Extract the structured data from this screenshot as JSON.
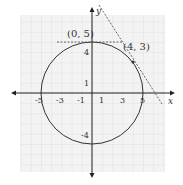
{
  "diagram": {
    "type": "coordinate-plane",
    "axes": {
      "x_label": "x",
      "y_label": "y",
      "x_tick_labels": [
        "-5",
        "-3",
        "-1",
        "1",
        "3",
        "5"
      ],
      "x_tick_values": [
        -5,
        -3,
        -1,
        1,
        3,
        5
      ],
      "y_tick_labels": [
        "4",
        "1",
        "-4"
      ],
      "y_tick_values": [
        4,
        1,
        -4
      ]
    },
    "circle": {
      "center": [
        0,
        0
      ],
      "radius": 5,
      "equation": "x^2 + y^2 = 25"
    },
    "points": [
      {
        "label": "(0, 5)",
        "x": 0,
        "y": 5
      },
      {
        "label": "(4, 3)",
        "x": 4,
        "y": 3
      }
    ],
    "tangent_lines": [
      {
        "through": [
          0,
          5
        ],
        "equation": "y = 5",
        "style": "dashed"
      },
      {
        "through": [
          4,
          3
        ],
        "equation": "y = -4/3 x + 25/3",
        "style": "dashed"
      }
    ],
    "grid": {
      "on": true,
      "x_range": [
        -7,
        7
      ],
      "y_range": [
        -7.5,
        7.5
      ]
    },
    "colors": {
      "grid": "#d8d8d8",
      "curve": "#333333",
      "axis": "#222222",
      "background": "#f4f4f4"
    }
  }
}
